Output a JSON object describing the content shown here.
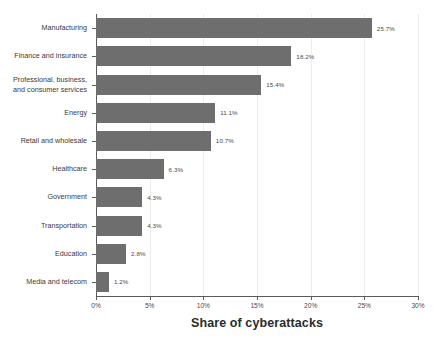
{
  "chart_data": {
    "type": "bar",
    "orientation": "horizontal",
    "title": "",
    "xlabel": "Share of cyberattacks",
    "ylabel": "",
    "xlim": [
      0,
      30
    ],
    "xticks": [
      "0%",
      "5%",
      "10%",
      "15%",
      "20%",
      "25%",
      "30%"
    ],
    "xtick_values": [
      0,
      5,
      10,
      15,
      20,
      25,
      30
    ],
    "grid": "vertical-light",
    "legend": "none",
    "bar_color": "#6e6e6e",
    "categories": [
      "Manufacturing",
      "Finance and insurance",
      "Professional, business, and consumer services",
      "Energy",
      "Retail and wholesale",
      "Healthcare",
      "Government",
      "Transportation",
      "Education",
      "Media and telecom"
    ],
    "values": [
      25.7,
      18.2,
      15.4,
      11.1,
      10.7,
      6.3,
      4.3,
      4.3,
      2.8,
      1.2
    ],
    "value_labels": [
      "25.7%",
      "18.2%",
      "15.4%",
      "11.1%",
      "10.7%",
      "6.3%",
      "4.3%",
      "4.3%",
      "2.8%",
      "1.2%"
    ],
    "category_label_lines": [
      [
        "Manufacturing"
      ],
      [
        "Finance and insurance"
      ],
      [
        "Professional, business,",
        "and consumer services"
      ],
      [
        "Energy"
      ],
      [
        "Retail and wholesale"
      ],
      [
        "Healthcare"
      ],
      [
        "Government"
      ],
      [
        "Transportation"
      ],
      [
        "Education"
      ],
      [
        "Media and telecom"
      ]
    ]
  },
  "colors": {
    "bar": "#6e6e6e",
    "axis": "#5a5a5a",
    "grid": "#ececec",
    "text": "#3a3a3a",
    "background": "#ffffff"
  }
}
